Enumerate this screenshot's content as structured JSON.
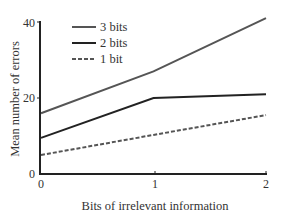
{
  "chart_data": {
    "type": "line",
    "title": "",
    "xlabel": "Bits of irrelevant information",
    "ylabel": "Mean number of errors",
    "x": [
      0,
      1,
      2
    ],
    "x_tick_labels": [
      "0",
      "1",
      "2"
    ],
    "y_ticks": [
      0,
      20,
      40
    ],
    "y_tick_labels": [
      "0",
      "20",
      "40"
    ],
    "xlim": [
      0,
      2
    ],
    "ylim": [
      0,
      40
    ],
    "grid": false,
    "legend_position": "upper-left",
    "series": [
      {
        "name": "3 bits",
        "values": [
          16,
          27,
          41
        ],
        "color": "#555555",
        "dash": "solid"
      },
      {
        "name": "2 bits",
        "values": [
          9.5,
          20,
          21
        ],
        "color": "#222222",
        "dash": "solid"
      },
      {
        "name": "1 bit",
        "values": [
          5,
          10.3,
          15.5
        ],
        "color": "#555555",
        "dash": "dashed"
      }
    ]
  }
}
